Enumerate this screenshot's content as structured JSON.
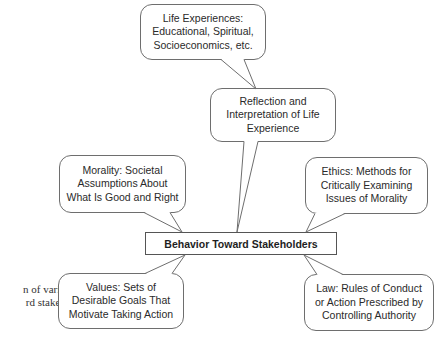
{
  "diagram": {
    "center": {
      "label": "Behavior Toward Stakeholders"
    },
    "nodes": {
      "life_experiences": {
        "lines": [
          "Life Experiences:",
          "Educational, Spiritual,",
          "Socioeconomics, etc."
        ]
      },
      "reflection": {
        "lines": [
          "Reflection and",
          "Interpretation of Life",
          "Experience"
        ]
      },
      "morality": {
        "lines": [
          "Morality: Societal",
          "Assumptions About",
          "What Is Good and Right"
        ]
      },
      "ethics": {
        "lines": [
          "Ethics: Methods for",
          "Critically Examining",
          "Issues of Morality"
        ]
      },
      "values": {
        "lines": [
          "Values: Sets of",
          "Desirable Goals That",
          "Motivate Taking Action"
        ]
      },
      "law": {
        "lines": [
          "Law: Rules of Conduct",
          "or Action Prescribed by",
          "Controlling Authority"
        ]
      }
    },
    "edges": [
      {
        "from": "life_experiences",
        "to": "reflection"
      },
      {
        "from": "reflection",
        "to": "center"
      },
      {
        "from": "morality",
        "to": "center"
      },
      {
        "from": "ethics",
        "to": "center"
      },
      {
        "from": "values",
        "to": "center"
      },
      {
        "from": "law",
        "to": "center"
      }
    ],
    "colors": {
      "stroke": "#6e6e6e",
      "text": "#2a2a2a",
      "background": "#ffffff"
    }
  },
  "side_text": {
    "lines": [
      "n of vari-",
      "rd stake-"
    ]
  }
}
